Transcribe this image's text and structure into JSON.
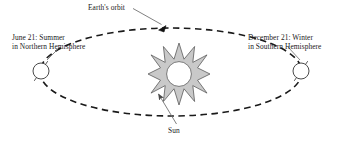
{
  "diagram": {
    "background_color": "#ffffff",
    "stroke_color": "#1a1a1a",
    "sun_fill_color": "#c8c8c8",
    "sun_core_color": "#ffffff",
    "labels": {
      "earth_orbit": "Earth's orbit",
      "sun": "Sun",
      "june_line1": "June 21: Summer",
      "june_line2": "in Northern Hemisphere",
      "december_line1": "December 21: Winter",
      "december_line2": "in Southern Hemisphere"
    },
    "orbit": {
      "shape": "ellipse",
      "style": "dashed",
      "center_x": 171,
      "center_y": 72,
      "radius_x": 131,
      "radius_y": 44,
      "direction_arrow": "counterclockwise-at-top"
    },
    "sun": {
      "center_x": 179,
      "center_y": 74,
      "points": 10,
      "outer_radius": 31,
      "inner_radius": 16,
      "core_radius": 12
    },
    "earths": [
      {
        "name": "earth-june",
        "center_x": 41,
        "center_y": 71,
        "radius": 8,
        "axis_tilt_deg": 23.5
      },
      {
        "name": "earth-december",
        "center_x": 301,
        "center_y": 71,
        "radius": 8,
        "axis_tilt_deg": 23.5
      }
    ]
  }
}
